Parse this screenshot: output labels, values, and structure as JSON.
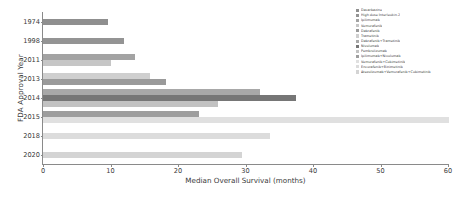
{
  "chart_data": {
    "type": "bar",
    "orientation": "horizontal",
    "title": "",
    "xlabel": "Median Overall Survival (months)",
    "ylabel": "FDA Approval Year",
    "categories": [
      "1974",
      "1998",
      "2011",
      "2013",
      "2014",
      "2015",
      "2018",
      "2020"
    ],
    "xlim": [
      0,
      60
    ],
    "xticks": [
      0,
      10,
      20,
      30,
      40,
      50,
      60
    ],
    "grid": false,
    "legend_position": "upper right",
    "series": [
      {
        "name": "Dacarbazine",
        "year": "1974",
        "value": 9.6,
        "color": "#8f8f8f"
      },
      {
        "name": "High dose Interleukin-2",
        "year": "1998",
        "value": 12.0,
        "color": "#949494"
      },
      {
        "name": "Ipilimumab",
        "year": "2011",
        "value": 13.7,
        "color": "#a3a3a3"
      },
      {
        "name": "Vemurafenib",
        "year": "2011",
        "value": 10.0,
        "color": "#c6c6c6"
      },
      {
        "name": "Trametinib",
        "year": "2013",
        "value": 15.9,
        "color": "#cfcfcf"
      },
      {
        "name": "Dabrafenib",
        "year": "2013",
        "value": 18.2,
        "color": "#9a9a9a"
      },
      {
        "name": "Dabrafenib+Trametinib",
        "year": "2014",
        "value": 32.1,
        "color": "#a8a8a8"
      },
      {
        "name": "Nivolumab",
        "year": "2014",
        "value": 37.5,
        "color": "#767676"
      },
      {
        "name": "Pembrolizumab",
        "year": "2014",
        "value": 25.9,
        "color": "#c2c2c2"
      },
      {
        "name": "Ipilimumab+Nivolumab",
        "year": "2015",
        "value": 23.1,
        "color": "#9e9e9e"
      },
      {
        "name": "Vemurafenib+Cobimetinib",
        "year": "2015",
        "value": 60.1,
        "color": "#e0e0e0"
      },
      {
        "name": "Encorafenib+Binimetinib",
        "year": "2018",
        "value": 33.6,
        "color": "#dcdcdc"
      },
      {
        "name": "Atezolizumab+Vemurafenib+Cobimetinib",
        "year": "2020",
        "value": 29.5,
        "color": "#d4d4d4"
      }
    ]
  },
  "axes": {
    "x_label": "Median Overall Survival (months)",
    "y_label": "FDA Approval Year",
    "x_ticks": [
      "0",
      "10",
      "20",
      "30",
      "40",
      "50",
      "60"
    ],
    "y_ticks": [
      "1974",
      "1998",
      "2011",
      "2013",
      "2014",
      "2015",
      "2018",
      "2020"
    ]
  },
  "legend": {
    "items": [
      "Dacarbazine",
      "High dose Interleukin-2",
      "Ipilimumab",
      "Vemurafenib",
      "Dabrafenib",
      "Trametinib",
      "Dabrafenib+Trametinib",
      "Nivolumab",
      "Pembrolizumab",
      "Ipilimumab+Nivolumab",
      "Vemurafenib+Cobimetinib",
      "Encorafenib+Binimetinib",
      "Atezolizumab+Vemurafenib+Cobimetinib"
    ],
    "colors": [
      "#8f8f8f",
      "#949494",
      "#a3a3a3",
      "#c6c6c6",
      "#9a9a9a",
      "#cfcfcf",
      "#a8a8a8",
      "#767676",
      "#c2c2c2",
      "#9e9e9e",
      "#e0e0e0",
      "#dcdcdc",
      "#d4d4d4"
    ]
  }
}
